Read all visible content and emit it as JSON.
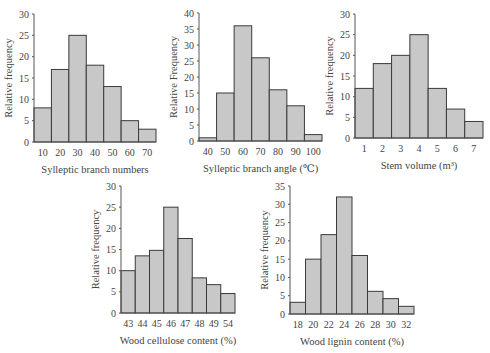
{
  "chart_data": [
    {
      "id": "c1",
      "type": "bar",
      "title": "",
      "xlabel": "Sylleptic branch numbers",
      "ylabel": "Relative frequency",
      "categories": [
        "10",
        "20",
        "30",
        "40",
        "50",
        "60",
        "70"
      ],
      "values": [
        8,
        17,
        25,
        18,
        13,
        5,
        3
      ],
      "ylim": [
        0,
        30
      ],
      "yticks": [
        0,
        5,
        10,
        15,
        20,
        25,
        30
      ],
      "grid": false,
      "box": {
        "x0": 34,
        "x1": 156,
        "ytop": 14,
        "ybot": 142
      }
    },
    {
      "id": "c2",
      "type": "bar",
      "title": "",
      "xlabel": "Sylleptic branch angle (℃)",
      "ylabel": "Relative Frequency",
      "categories": [
        "40",
        "50",
        "60",
        "70",
        "80",
        "90",
        "100"
      ],
      "values": [
        1,
        15,
        36,
        26,
        16,
        11,
        2
      ],
      "ylim": [
        0,
        40
      ],
      "yticks": [
        0,
        5,
        10,
        15,
        20,
        25,
        30,
        35,
        40
      ],
      "grid": false,
      "box": {
        "x0": 199,
        "x1": 322,
        "ytop": 13,
        "ybot": 141
      }
    },
    {
      "id": "c3",
      "type": "bar",
      "title": "",
      "xlabel": "Stem volume (m³)",
      "ylabel": "Relative frequency",
      "categories": [
        "1",
        "2",
        "3",
        "4",
        "5",
        "6",
        "7"
      ],
      "values": [
        12,
        18,
        20,
        25,
        12,
        7,
        4
      ],
      "ylim": [
        0,
        30
      ],
      "yticks": [
        0,
        5,
        10,
        15,
        20,
        25,
        30
      ],
      "grid": false,
      "box": {
        "x0": 355,
        "x1": 483,
        "ytop": 14,
        "ybot": 138
      }
    },
    {
      "id": "c4",
      "type": "bar",
      "title": "",
      "xlabel": "Wood cellulose content (%)",
      "ylabel": "Relative frequency",
      "categories": [
        "43",
        "44",
        "45",
        "46",
        "47",
        "48",
        "49",
        "54"
      ],
      "values": [
        10,
        13.5,
        14.8,
        25,
        17.6,
        8.3,
        6.7,
        4.6
      ],
      "ylim": [
        0,
        30
      ],
      "yticks": [
        0,
        5,
        10,
        15,
        20,
        25,
        30
      ],
      "grid": false,
      "box": {
        "x0": 121,
        "x1": 235,
        "ytop": 186,
        "ybot": 313
      }
    },
    {
      "id": "c5",
      "type": "bar",
      "title": "",
      "xlabel": "Wood lignin content (%)",
      "ylabel": "Relative frequency",
      "categories": [
        "18",
        "20",
        "22",
        "24",
        "26",
        "28",
        "30",
        "32"
      ],
      "values": [
        3.2,
        15,
        21.7,
        32,
        16,
        6.2,
        4.2,
        2.1
      ],
      "ylim": [
        0,
        35
      ],
      "yticks": [
        0,
        5,
        10,
        15,
        20,
        25,
        30,
        35
      ],
      "grid": false,
      "box": {
        "x0": 290,
        "x1": 414,
        "ytop": 186,
        "ybot": 314
      }
    }
  ],
  "style": {
    "bar_fill": "#c8c8c8",
    "bar_stroke": "#3a3a3a",
    "axis_color": "#555555",
    "text_color": "#444444"
  }
}
